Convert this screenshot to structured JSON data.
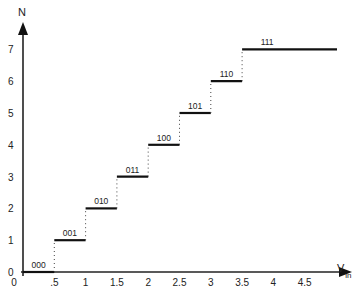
{
  "chart_data": {
    "type": "line",
    "subtype": "step",
    "title": "",
    "xlabel": "V",
    "xlabel_subscript": "in",
    "ylabel": "N",
    "xlim": [
      0,
      5
    ],
    "ylim": [
      0,
      7.5
    ],
    "x_ticks": [
      "0",
      ".5",
      "1",
      "1.5",
      "2",
      "2.5",
      "3",
      "3.5",
      "4",
      "4.5"
    ],
    "x_tick_values": [
      0,
      0.5,
      1,
      1.5,
      2,
      2.5,
      3,
      3.5,
      4,
      4.5
    ],
    "y_ticks": [
      "0",
      "1",
      "2",
      "3",
      "4",
      "5",
      "6",
      "7"
    ],
    "y_tick_values": [
      0,
      1,
      2,
      3,
      4,
      5,
      6,
      7
    ],
    "grid": false,
    "legend": null,
    "steps": [
      {
        "x_start": 0,
        "x_end": 0.5,
        "y": 0,
        "code": "000"
      },
      {
        "x_start": 0.5,
        "x_end": 1.0,
        "y": 1,
        "code": "001"
      },
      {
        "x_start": 1.0,
        "x_end": 1.5,
        "y": 2,
        "code": "010"
      },
      {
        "x_start": 1.5,
        "x_end": 2.0,
        "y": 3,
        "code": "011"
      },
      {
        "x_start": 2.0,
        "x_end": 2.5,
        "y": 4,
        "code": "100"
      },
      {
        "x_start": 2.5,
        "x_end": 3.0,
        "y": 5,
        "code": "101"
      },
      {
        "x_start": 3.0,
        "x_end": 3.5,
        "y": 6,
        "code": "110"
      },
      {
        "x_start": 3.5,
        "x_end": 5.0,
        "y": 7,
        "code": "111"
      }
    ]
  }
}
